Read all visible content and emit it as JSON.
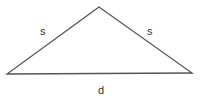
{
  "diagram": {
    "type": "isosceles-triangle",
    "labels": {
      "left_side": "s",
      "right_side": "s",
      "base": "d"
    },
    "vertices": {
      "apex": [
        99,
        7
      ],
      "left": [
        7,
        74
      ],
      "right": [
        192,
        73
      ]
    },
    "stroke_color": "#555555"
  }
}
